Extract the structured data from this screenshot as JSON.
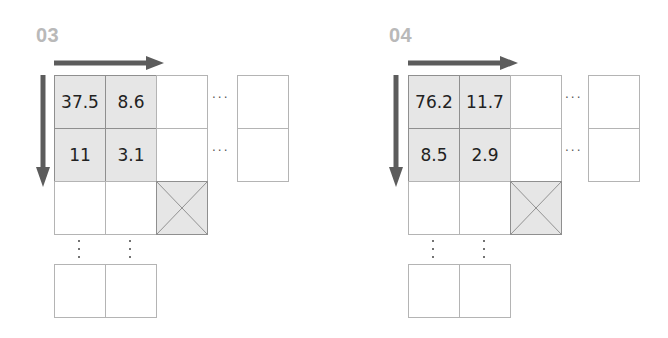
{
  "panels": [
    {
      "label": "03",
      "values": [
        [
          "37.5",
          "8.6"
        ],
        [
          "11",
          "3.1"
        ]
      ],
      "ellipsis": "···"
    },
    {
      "label": "04",
      "values": [
        [
          "76.2",
          "11.7"
        ],
        [
          "8.5",
          "2.9"
        ]
      ],
      "ellipsis": "···"
    }
  ],
  "colors": {
    "arrow": "#5c5c5c",
    "shaded_cell": "#e6e6e6",
    "label": "#b9b9b9"
  }
}
